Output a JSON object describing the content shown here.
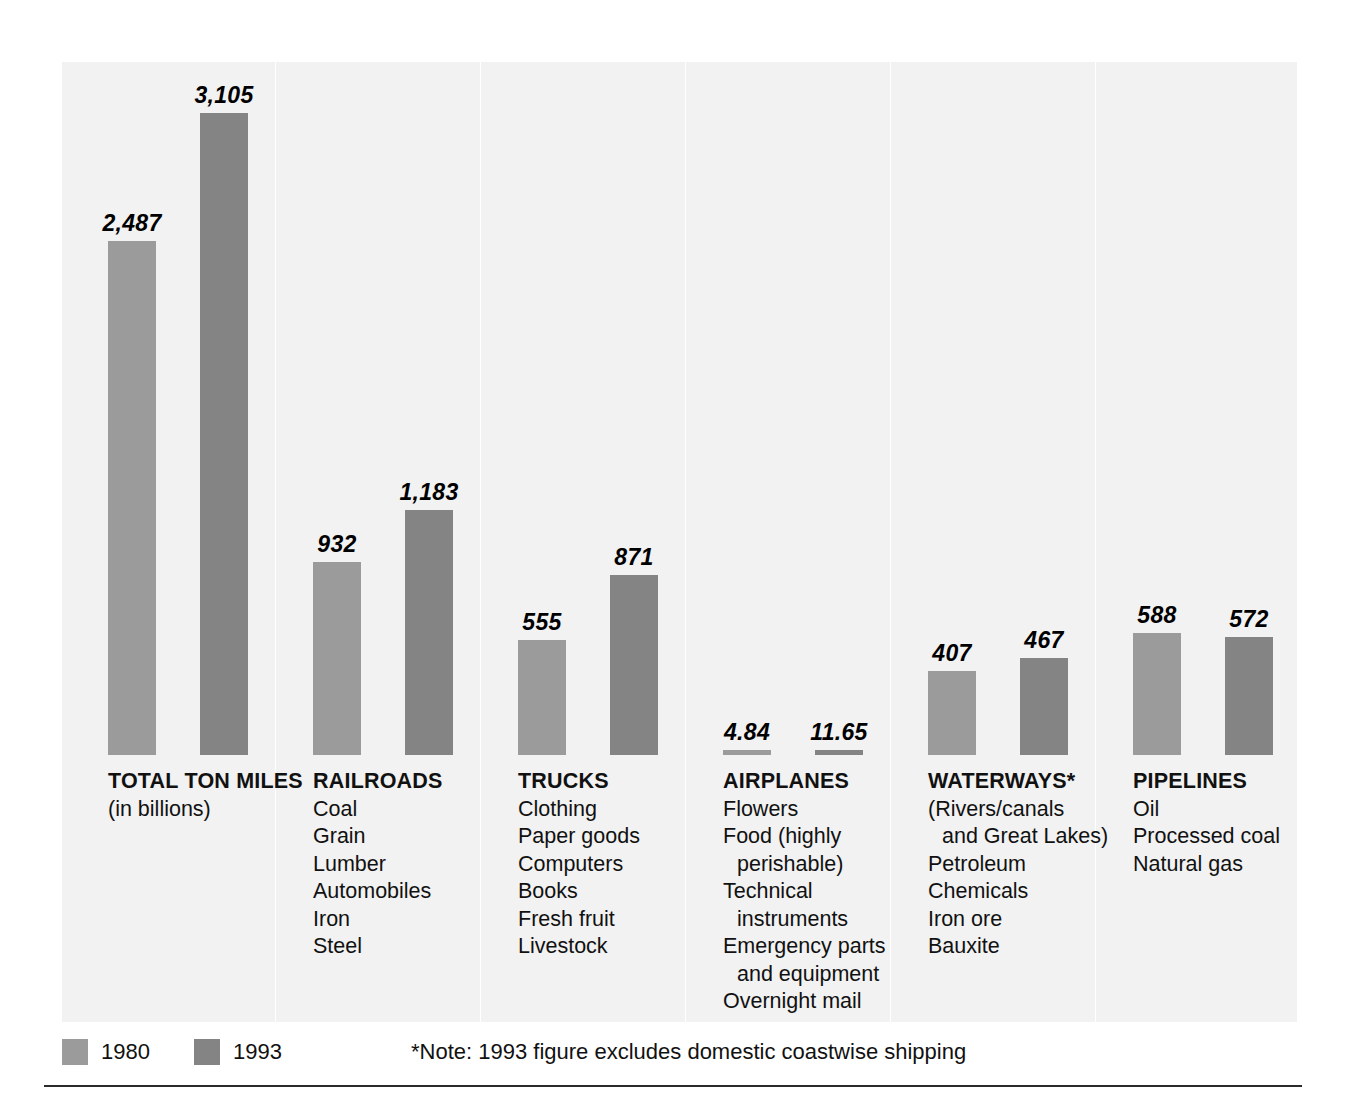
{
  "chart_data": {
    "type": "bar",
    "title": "",
    "subtitle": "",
    "xlabel": "",
    "ylabel": "",
    "ylim": [
      0,
      3400
    ],
    "grid": false,
    "legend_position": "bottom-left",
    "value_unit": "billions of ton miles",
    "categories": [
      "TOTAL TON MILES",
      "RAILROADS",
      "TRUCKS",
      "AIRPLANES",
      "WATERWAYS*",
      "PIPELINES"
    ],
    "series": [
      {
        "name": "1980",
        "color": "#9b9b9b",
        "values": [
          2487,
          932,
          555,
          4.84,
          407,
          588
        ]
      },
      {
        "name": "1993",
        "color": "#848484",
        "values": [
          3105,
          1183,
          871,
          11.65,
          467,
          572
        ]
      }
    ],
    "value_labels": [
      [
        "2,487",
        "3,105"
      ],
      [
        "932",
        "1,183"
      ],
      [
        "555",
        "871"
      ],
      [
        "4.84",
        "11.65"
      ],
      [
        "407",
        "467"
      ],
      [
        "588",
        "572"
      ]
    ],
    "annotations": [
      "*Note: 1993 figure excludes domestic coastwise shipping"
    ]
  },
  "groups": [
    {
      "title": "TOTAL TON MILES",
      "items": [
        {
          "text": "(in billions)",
          "indent": false
        }
      ],
      "bars": [
        {
          "series": "1980",
          "value": 2487,
          "label": "2,487"
        },
        {
          "series": "1993",
          "value": 3105,
          "label": "3,105"
        }
      ]
    },
    {
      "title": "RAILROADS",
      "items": [
        {
          "text": "Coal",
          "indent": false
        },
        {
          "text": "Grain",
          "indent": false
        },
        {
          "text": "Lumber",
          "indent": false
        },
        {
          "text": "Automobiles",
          "indent": false
        },
        {
          "text": "Iron",
          "indent": false
        },
        {
          "text": "Steel",
          "indent": false
        }
      ],
      "bars": [
        {
          "series": "1980",
          "value": 932,
          "label": "932"
        },
        {
          "series": "1993",
          "value": 1183,
          "label": "1,183"
        }
      ]
    },
    {
      "title": "TRUCKS",
      "items": [
        {
          "text": "Clothing",
          "indent": false
        },
        {
          "text": "Paper goods",
          "indent": false
        },
        {
          "text": "Computers",
          "indent": false
        },
        {
          "text": "Books",
          "indent": false
        },
        {
          "text": "Fresh fruit",
          "indent": false
        },
        {
          "text": "Livestock",
          "indent": false
        }
      ],
      "bars": [
        {
          "series": "1980",
          "value": 555,
          "label": "555"
        },
        {
          "series": "1993",
          "value": 871,
          "label": "871"
        }
      ]
    },
    {
      "title": "AIRPLANES",
      "items": [
        {
          "text": "Flowers",
          "indent": false
        },
        {
          "text": "Food (highly",
          "indent": false
        },
        {
          "text": "perishable)",
          "indent": true
        },
        {
          "text": "Technical",
          "indent": false
        },
        {
          "text": "instruments",
          "indent": true
        },
        {
          "text": "Emergency parts",
          "indent": false
        },
        {
          "text": "and equipment",
          "indent": true
        },
        {
          "text": "Overnight mail",
          "indent": false
        }
      ],
      "bars": [
        {
          "series": "1980",
          "value": 4.84,
          "label": "4.84"
        },
        {
          "series": "1993",
          "value": 11.65,
          "label": "11.65"
        }
      ]
    },
    {
      "title": "WATERWAYS*",
      "items": [
        {
          "text": "(Rivers/canals",
          "indent": false
        },
        {
          "text": "and Great Lakes)",
          "indent": true
        },
        {
          "text": "Petroleum",
          "indent": false
        },
        {
          "text": "Chemicals",
          "indent": false
        },
        {
          "text": "Iron ore",
          "indent": false
        },
        {
          "text": "Bauxite",
          "indent": false
        }
      ],
      "bars": [
        {
          "series": "1980",
          "value": 407,
          "label": "407"
        },
        {
          "series": "1993",
          "value": 467,
          "label": "467"
        }
      ]
    },
    {
      "title": "PIPELINES",
      "items": [
        {
          "text": "Oil",
          "indent": false
        },
        {
          "text": "Processed coal",
          "indent": false
        },
        {
          "text": "Natural gas",
          "indent": false
        }
      ],
      "bars": [
        {
          "series": "1980",
          "value": 588,
          "label": "588"
        },
        {
          "series": "1993",
          "value": 572,
          "label": "572"
        }
      ]
    }
  ],
  "legend": {
    "entries": [
      {
        "label": "1980",
        "color": "#9b9b9b"
      },
      {
        "label": "1993",
        "color": "#848484"
      }
    ]
  },
  "note": {
    "text": "*Note: 1993 figure excludes domestic coastwise shipping"
  },
  "colors": {
    "panel_background": "#f2f2f2",
    "bar_1980": "#9b9b9b",
    "bar_1993": "#848484",
    "divider": "#ffffff",
    "rule": "#2b2b2b"
  }
}
